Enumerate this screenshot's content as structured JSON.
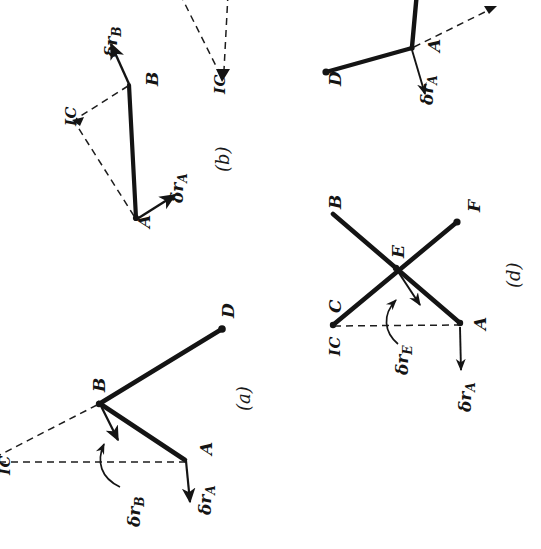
{
  "document": {
    "kind": "scanned-textbook-figure",
    "orientation_note": "page rotated 90 degrees counter-clockwise",
    "ink_color": "#141414",
    "paper_color": "#ffffff"
  },
  "figures": [
    {
      "id": "a",
      "caption": "(a)",
      "points": [
        "A",
        "B",
        "D"
      ],
      "ic_label": "IC",
      "vectors": [
        {
          "name": "drA",
          "symbol": "δr",
          "subscript": "A",
          "at": "A"
        },
        {
          "name": "drB",
          "symbol": "δr",
          "subscript": "B",
          "at": "B"
        }
      ]
    },
    {
      "id": "b",
      "caption": "(b)",
      "points": [
        "A",
        "B"
      ],
      "ic_label": "IC",
      "vectors": [
        {
          "name": "drA",
          "symbol": "δr",
          "subscript": "A",
          "at": "A"
        },
        {
          "name": "drB",
          "symbol": "δr",
          "subscript": "B",
          "at": "B"
        }
      ]
    },
    {
      "id": "c",
      "caption": "(c)",
      "points": [
        "A",
        "D"
      ],
      "ic_label": "IC",
      "vectors": [
        {
          "name": "drA",
          "symbol": "δr",
          "subscript": "A",
          "at": "A"
        }
      ]
    },
    {
      "id": "d",
      "caption": "(d)",
      "points": [
        "A",
        "B",
        "C",
        "E",
        "F"
      ],
      "ic_label": "IC",
      "vectors": [
        {
          "name": "drA",
          "symbol": "δr",
          "subscript": "A",
          "at": "A"
        },
        {
          "name": "drE",
          "symbol": "δr",
          "subscript": "E",
          "at": "E"
        }
      ]
    }
  ],
  "labels": {
    "A": "A",
    "B": "B",
    "C": "C",
    "D": "D",
    "E": "E",
    "F": "F",
    "IC": "IC",
    "delta": "δ",
    "r": "r",
    "cap_a": "(a)",
    "cap_b": "(b)",
    "cap_c": "(c)",
    "cap_d": "(d)"
  }
}
